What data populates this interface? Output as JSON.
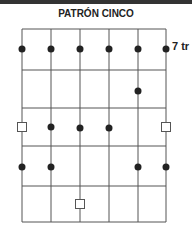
{
  "title": "PATRÓN CINCO",
  "fret_label": "7 tr",
  "diagram": {
    "strings": 6,
    "frets": 5,
    "string_x": [
      22,
      51,
      80,
      109,
      138,
      166
    ],
    "fret_y": [
      29,
      70,
      108,
      146,
      186,
      222
    ],
    "notes": [
      {
        "type": "dot",
        "string": 0,
        "row": 0
      },
      {
        "type": "dot",
        "string": 1,
        "row": 0
      },
      {
        "type": "dot",
        "string": 2,
        "row": 0
      },
      {
        "type": "dot",
        "string": 3,
        "row": 0
      },
      {
        "type": "dot",
        "string": 4,
        "row": 0
      },
      {
        "type": "dot",
        "string": 5,
        "row": 0
      },
      {
        "type": "dot",
        "string": 4,
        "row": "1b"
      },
      {
        "type": "square",
        "string": 0,
        "row": 2
      },
      {
        "type": "dot",
        "string": 1,
        "row": 2
      },
      {
        "type": "dot",
        "string": 2,
        "row": 2
      },
      {
        "type": "dot",
        "string": 3,
        "row": 2
      },
      {
        "type": "square",
        "string": 5,
        "row": 2
      },
      {
        "type": "dot",
        "string": 0,
        "row": 3
      },
      {
        "type": "dot",
        "string": 1,
        "row": 3
      },
      {
        "type": "dot",
        "string": 4,
        "row": 3
      },
      {
        "type": "dot",
        "string": 5,
        "row": 3
      },
      {
        "type": "square",
        "string": 2,
        "row": 4
      }
    ]
  }
}
